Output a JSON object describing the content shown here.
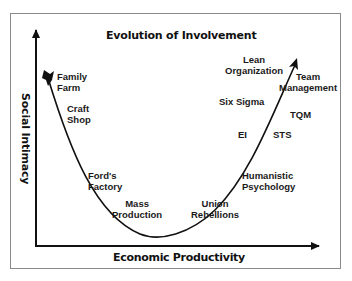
{
  "title": "Evolution of Involvement",
  "axes": {
    "x_label": "Economic Productivity",
    "y_label": "Social Intimacy"
  },
  "labels": {
    "family_farm": [
      "Family",
      "Farm"
    ],
    "craft_shop": [
      "Craft",
      "Shop"
    ],
    "fords_factory": [
      "Ford's",
      "Factory"
    ],
    "mass_production": [
      "Mass",
      "Production"
    ],
    "union_rebellions": [
      "Union",
      "Rebellions"
    ],
    "humanistic_psychology": [
      "Humanistic",
      "Psychology"
    ],
    "ei": "EI",
    "sts": "STS",
    "tqm": "TQM",
    "six_sigma": "Six Sigma",
    "lean_organization": [
      "Lean",
      "Organization"
    ],
    "team_management": [
      "Team",
      "Management"
    ]
  },
  "colors": {
    "line": "#111111",
    "frame": "#8a8a8a",
    "text": "#1a1a1a"
  }
}
